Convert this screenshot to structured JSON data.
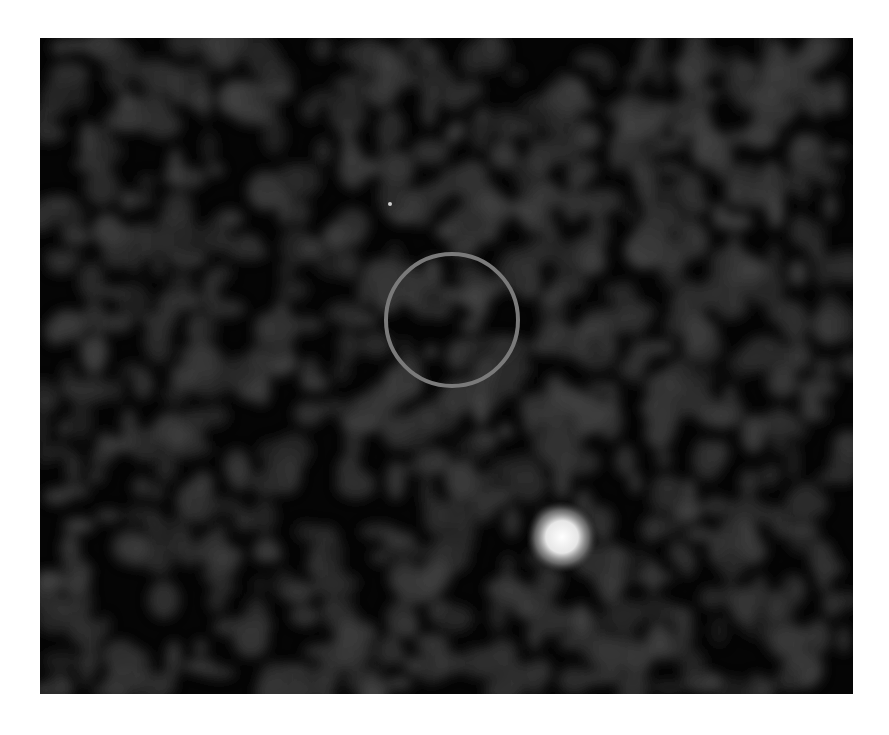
{
  "image": {
    "description": "Dark noisy astronomical image with a gray circular marker and a bright point source",
    "background_color": "#050505",
    "noise_color": "#3a3a3a",
    "marker": {
      "shape": "circle",
      "color": "#7a7a7a",
      "cx": 412,
      "cy": 282,
      "r": 66,
      "stroke_width": 4
    },
    "sources": [
      {
        "name": "bright-source",
        "cx": 522,
        "cy": 499,
        "r": 26,
        "color": "#e8e8e8"
      },
      {
        "name": "faint-speck",
        "cx": 350,
        "cy": 166,
        "r": 2,
        "color": "#cfcfcf"
      }
    ]
  }
}
